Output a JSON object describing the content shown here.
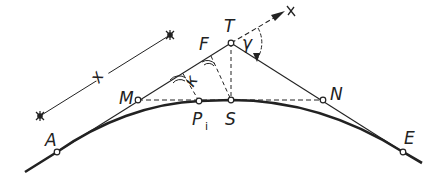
{
  "diagram": {
    "type": "geometric construction — circular curve with tangents",
    "points": {
      "A": {
        "label": "A",
        "x": 57,
        "y": 152
      },
      "M": {
        "label": "M",
        "x": 138,
        "y": 100
      },
      "F": {
        "label": "F",
        "x": 211,
        "y": 56
      },
      "T": {
        "label": "T",
        "x": 231,
        "y": 43
      },
      "S": {
        "label": "S",
        "x": 231,
        "y": 100
      },
      "Pi": {
        "label": "P",
        "sub": "i",
        "x": 199,
        "y": 101
      },
      "N": {
        "label": "N",
        "x": 323,
        "y": 100
      },
      "E": {
        "label": "E",
        "x": 403,
        "y": 152
      }
    },
    "axis": {
      "label": "x",
      "direction": "along tangent A–T, arrow beyond T"
    },
    "dimension": {
      "label": "x",
      "description": "dimension line parallel to tangent"
    },
    "angles": {
      "gamma": {
        "label": "γ",
        "at": "T",
        "between": "x-axis and tangent T–E"
      },
      "kappa": {
        "label": "κ",
        "at": "perpendicular foot from Pi to tangent"
      }
    },
    "colors": {
      "stroke": "#222222",
      "background": "#ffffff"
    }
  }
}
